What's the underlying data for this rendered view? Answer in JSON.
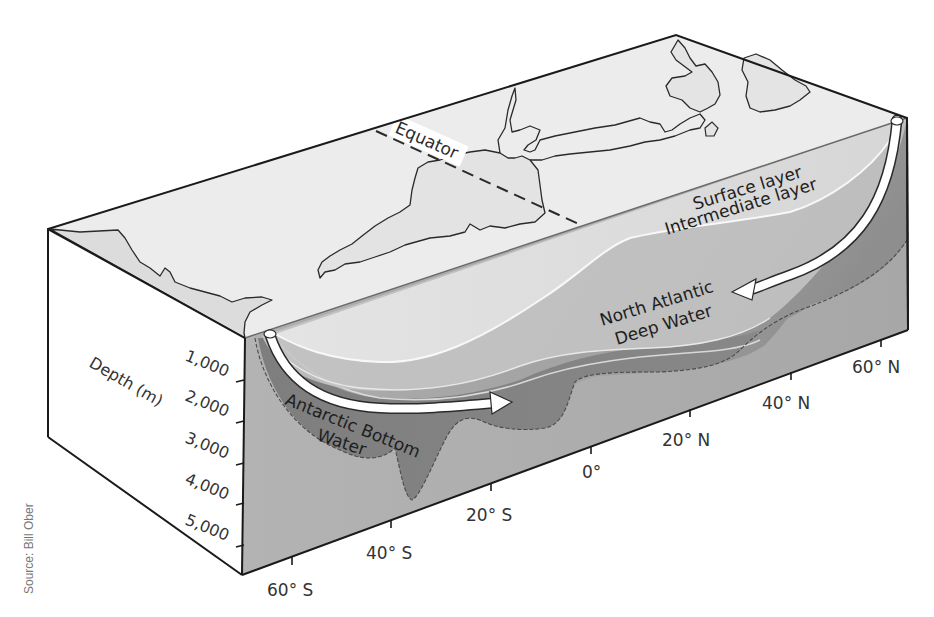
{
  "diagram": {
    "equator_label": "Equator",
    "layer_labels": {
      "surface": "Surface layer",
      "intermediate": "Intermediate layer",
      "nadw_line1": "North Atlantic",
      "nadw_line2": "Deep Water",
      "aabw_line1": "Antarctic Bottom",
      "aabw_line2": "Water"
    },
    "depth_axis": {
      "title": "Depth (m)",
      "ticks": [
        "1,000",
        "2,000",
        "3,000",
        "4,000",
        "5,000"
      ]
    },
    "latitude_axis": {
      "ticks": [
        "60° S",
        "40° S",
        "20° S",
        "0°",
        "20° N",
        "40° N",
        "60° N"
      ]
    },
    "source": "Source: Bill Ober",
    "colors": {
      "land_top": "#e9e9e9",
      "side_face": "#ffffff",
      "seafloor": "#b9b9b9",
      "surface_layer": "#e2e2e2",
      "intermediate_layer": "#c8c8c8",
      "nadw": "#a9a9a9",
      "aabw": "#7d7d7d",
      "arrow": "#ffffff",
      "outline": "#1a1a1a"
    }
  }
}
